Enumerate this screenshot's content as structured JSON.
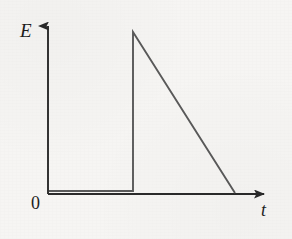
{
  "figure": {
    "kind": "line-graph",
    "background_color": "#f6f5f3",
    "ink_color": "#2a2a2a",
    "curve_color": "#5a5a5a"
  },
  "labels": {
    "y_axis": "E",
    "x_axis": "t",
    "origin": "0"
  },
  "chart_data": {
    "type": "line",
    "title": "",
    "subtitle": "",
    "xlabel": "t",
    "ylabel": "E",
    "grid": false,
    "legend": false,
    "xlim": [
      0,
      1
    ],
    "ylim": [
      0,
      1
    ],
    "x_ticks": [],
    "y_ticks": [],
    "tick_labels": [
      "0"
    ],
    "annotations": [],
    "series": [
      {
        "name": "E(t)",
        "color": "#5a5a5a",
        "x": [
          0.0,
          0.386,
          0.386,
          0.85
        ],
        "y": [
          0.0,
          0.0,
          1.0,
          0.0
        ],
        "description": "sawtooth: zero baseline, instantaneous rise to peak, then linear decay to zero"
      }
    ]
  },
  "geometry": {
    "origin_px": [
      48,
      194
    ],
    "y_axis_top_px": [
      48,
      20
    ],
    "x_axis_end_px": [
      272,
      194
    ],
    "baseline_end_px": [
      133,
      191
    ],
    "peak_px": [
      133,
      32
    ],
    "decay_end_px": [
      235,
      193
    ]
  }
}
